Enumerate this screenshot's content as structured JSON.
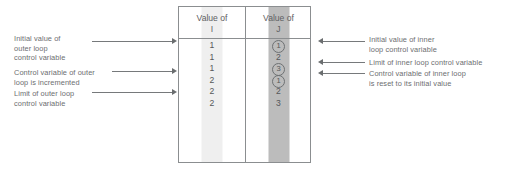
{
  "diagram": {
    "accent_color": "#6c6e70",
    "line_color": "#76797b",
    "strip_color_i": "#efefef",
    "strip_color_j": "#bcbcbc"
  },
  "table": {
    "columns": [
      {
        "header_line1": "Value of",
        "header_line2": "I",
        "name": "column-i",
        "cells": [
          {
            "text": "1",
            "circled": false
          },
          {
            "text": "1",
            "circled": false
          },
          {
            "text": "1",
            "circled": false
          },
          {
            "text": "2",
            "circled": false
          },
          {
            "text": "2",
            "circled": false
          },
          {
            "text": "2",
            "circled": false
          }
        ]
      },
      {
        "header_line1": "Value of",
        "header_line2": "J",
        "name": "column-j",
        "cells": [
          {
            "text": "1",
            "circled": true
          },
          {
            "text": "2",
            "circled": false
          },
          {
            "text": "3",
            "circled": true
          },
          {
            "text": "1",
            "circled": true
          },
          {
            "text": "2",
            "circled": false
          },
          {
            "text": "3",
            "circled": false
          }
        ]
      }
    ]
  },
  "annotations": {
    "left": [
      {
        "id": "initial-value-outer",
        "text": "Initial value of\nouter loop\ncontrol variable"
      },
      {
        "id": "control-variable-outer-incremented",
        "text": "Control variable of outer\nloop is incremented"
      },
      {
        "id": "limit-outer",
        "text": "Limit of outer loop\ncontrol variable"
      }
    ],
    "right": [
      {
        "id": "initial-value-inner",
        "text": "Initial value of inner\nloop control variable"
      },
      {
        "id": "limit-inner",
        "text": "Limit of inner loop control variable"
      },
      {
        "id": "control-variable-inner-reset",
        "text": "Control variable of inner loop\nis reset to its initial value"
      }
    ]
  }
}
